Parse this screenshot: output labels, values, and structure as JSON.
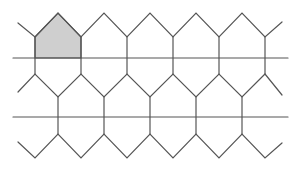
{
  "diagram": {
    "colors": {
      "stroke": "#555555",
      "shaded_fill": "#cfcfcf",
      "background": "#ffffff"
    },
    "horizontal_lines": [
      {
        "y": 58,
        "x1": 13,
        "x2": 288
      },
      {
        "y": 117,
        "x1": 13,
        "x2": 288
      }
    ],
    "shaded_region": {
      "shape": "pentagon",
      "points": [
        [
          35,
          37
        ],
        [
          58,
          13
        ],
        [
          81,
          37
        ],
        [
          81,
          58
        ],
        [
          35,
          58
        ]
      ]
    }
  }
}
